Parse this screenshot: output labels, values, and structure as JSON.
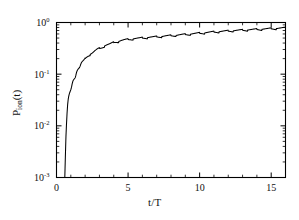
{
  "figure": {
    "background_color": "#ffffff",
    "line_color": "#000000",
    "axis_color": "#000000"
  },
  "axes": {
    "x_title_main": "t/T",
    "y_title_base": "P",
    "y_title_sub": "ion",
    "y_title_tail": "(t)",
    "x_ticks": [
      "0",
      "5",
      "10",
      "15"
    ],
    "y_ticks": [
      "10",
      "10",
      "10",
      "10"
    ],
    "y_tick_exponents": [
      "0",
      "-1",
      "-2",
      "-3"
    ]
  },
  "chart_data": {
    "type": "line",
    "title": "",
    "xlabel": "t/T",
    "ylabel": "P_ion(t)",
    "xlim": [
      0,
      16
    ],
    "ylim": [
      0.001,
      1.0
    ],
    "yscale": "log",
    "xscale": "linear",
    "grid": false,
    "legend": null,
    "xticks": [
      0,
      5,
      10,
      15
    ],
    "yticks": [
      0.001,
      0.01,
      0.1,
      1.0
    ],
    "series": [
      {
        "name": "P_ion(t)",
        "color": "#000000",
        "x": [
          0.58,
          0.6,
          0.63,
          0.66,
          0.7,
          0.74,
          0.78,
          0.82,
          0.86,
          0.9,
          0.95,
          1.0,
          1.05,
          1.1,
          1.15,
          1.2,
          1.25,
          1.3,
          1.35,
          1.4,
          1.45,
          1.5,
          1.55,
          1.6,
          1.65,
          1.7,
          1.75,
          1.8,
          1.85,
          1.9,
          1.95,
          2.0,
          2.1,
          2.2,
          2.3,
          2.4,
          2.5,
          2.6,
          2.7,
          2.8,
          2.9,
          3.0,
          3.1,
          3.2,
          3.3,
          3.4,
          3.5,
          3.6,
          3.7,
          3.8,
          3.9,
          4.0,
          4.1,
          4.2,
          4.3,
          4.4,
          4.5,
          4.6,
          4.7,
          4.8,
          4.9,
          5.0,
          5.2,
          5.4,
          5.6,
          5.8,
          6.0,
          6.2,
          6.4,
          6.6,
          6.8,
          7.0,
          7.2,
          7.4,
          7.6,
          7.8,
          8.0,
          8.2,
          8.4,
          8.6,
          8.8,
          9.0,
          9.2,
          9.4,
          9.6,
          9.8,
          10.0,
          10.25,
          10.5,
          10.75,
          11.0,
          11.25,
          11.5,
          11.75,
          12.0,
          12.25,
          12.5,
          12.75,
          13.0,
          13.25,
          13.5,
          13.75,
          14.0,
          14.25,
          14.5,
          14.75,
          15.0,
          15.25,
          15.5,
          15.75,
          16.0
        ],
        "y": [
          0.001,
          0.0016,
          0.0032,
          0.0062,
          0.011,
          0.018,
          0.026,
          0.033,
          0.038,
          0.042,
          0.046,
          0.05,
          0.056,
          0.066,
          0.074,
          0.079,
          0.082,
          0.086,
          0.095,
          0.108,
          0.118,
          0.124,
          0.128,
          0.133,
          0.142,
          0.155,
          0.166,
          0.173,
          0.178,
          0.183,
          0.19,
          0.2,
          0.215,
          0.228,
          0.238,
          0.246,
          0.255,
          0.268,
          0.282,
          0.295,
          0.305,
          0.313,
          0.322,
          0.333,
          0.345,
          0.356,
          0.365,
          0.372,
          0.379,
          0.388,
          0.398,
          0.408,
          0.416,
          0.422,
          0.428,
          0.435,
          0.443,
          0.45,
          0.456,
          0.46,
          0.464,
          0.468,
          0.476,
          0.484,
          0.49,
          0.494,
          0.5,
          0.506,
          0.512,
          0.517,
          0.521,
          0.526,
          0.532,
          0.538,
          0.544,
          0.549,
          0.554,
          0.56,
          0.566,
          0.572,
          0.578,
          0.584,
          0.59,
          0.597,
          0.604,
          0.611,
          0.618,
          0.627,
          0.636,
          0.645,
          0.653,
          0.661,
          0.668,
          0.675,
          0.682,
          0.689,
          0.696,
          0.702,
          0.708,
          0.714,
          0.72,
          0.726,
          0.732,
          0.738,
          0.744,
          0.75,
          0.756,
          0.762,
          0.768,
          0.775,
          0.782
        ],
        "oscillation": {
          "present": true,
          "description": "periodic sawtooth ripple of one cycle per optical period riding on the rising plateau",
          "period": 1.0,
          "onset_x": 1.0,
          "relative_amplitude": 0.055
        }
      }
    ]
  }
}
